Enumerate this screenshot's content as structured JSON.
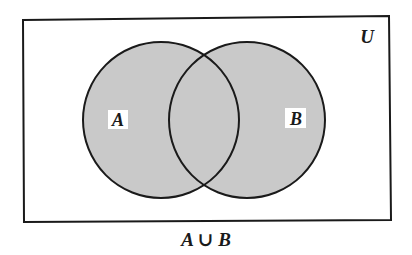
{
  "diagram": {
    "type": "venn",
    "universe_label": "U",
    "sets": [
      {
        "label": "A",
        "cx": 161,
        "cy": 120,
        "r": 78
      },
      {
        "label": "B",
        "cx": 247,
        "cy": 120,
        "r": 78
      }
    ],
    "shaded_region": "A ∪ B",
    "caption": "A ∪ B",
    "colors": {
      "shade": "#c9c9c9",
      "stroke": "#1a1a1a",
      "background": "#ffffff",
      "label_box": "#ffffff"
    }
  }
}
